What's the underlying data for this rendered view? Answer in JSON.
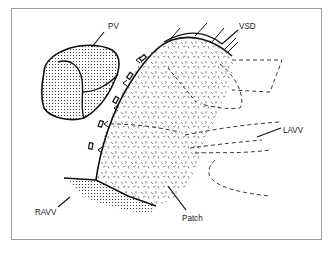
{
  "figure": {
    "labels": {
      "pv": "PV",
      "vsd": "VSD",
      "lavv": "LAVV",
      "ravv": "RAVV",
      "patch": "Patch"
    },
    "colors": {
      "line": "#1a1a1a",
      "frame": "#9a9a9a",
      "background": "#ffffff"
    }
  }
}
